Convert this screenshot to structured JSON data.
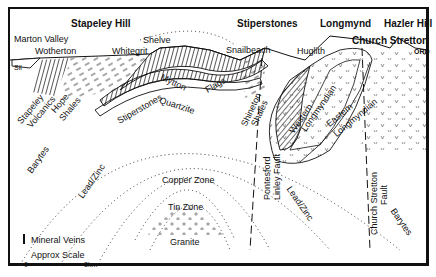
{
  "diagram": {
    "title_places": {
      "stapeley_hill": "Stapeley Hill",
      "stiperstones": "Stiperstones",
      "longmynd": "Longmynd",
      "hazler_hill": "Hazler Hill",
      "church_stretton": "Church Stretton"
    },
    "localities": {
      "marton_valley": "Marton Valley",
      "wotherton": "Wotherton",
      "whitegrit": "Whitegrit",
      "shelve": "Shelve",
      "snailbeach": "Snailbeach",
      "huglith": "Huglith"
    },
    "formations": {
      "stapeley": "Stapeley",
      "volcanics": "Volcanics",
      "hope": "Hope",
      "shales": "Shales",
      "stiperstones": "Stiperstones",
      "quartzite": "Quartzite",
      "mytton": "Mytton",
      "flags": "Flags",
      "shineton": "Shineton",
      "shineton_shales": "Shales",
      "western": "Western",
      "western_longmyndian": "Longmyndian",
      "eastern": "Eastern",
      "eastern_longmyndian": "Longmyndian",
      "sil": "Sil",
      "ord": "ORD"
    },
    "faults": {
      "pontesford_1": "Pontesford",
      "pontesford_2": "Linley Fault",
      "church_stretton_1": "Church Stretton",
      "church_stretton_2": "Fault"
    },
    "zones": {
      "barytes_left": "Barytes",
      "lead_zinc_left": "Lead/Zinc",
      "copper": "Copper Zone",
      "tin": "Tin Zone",
      "granite": "Granite",
      "lead_zinc_right": "Lead/Zinc",
      "barytes_right": "Barytes"
    },
    "legend": {
      "mineral_veins": "Mineral Veins",
      "approx_scale": "Approx Scale",
      "scale_start": "0",
      "scale_end": "3km"
    },
    "colors": {
      "ink": "#111111",
      "background": "#ffffff"
    }
  }
}
